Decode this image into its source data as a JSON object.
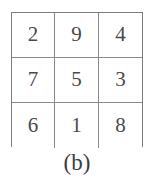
{
  "figure": {
    "caption": "(b)",
    "background_color": "#ffffff",
    "grid_line_color": "#8a8a8a",
    "border_color": "#7c7c7c",
    "digit_color": "#4a4a4a"
  },
  "chart_data": {
    "type": "table",
    "title": "(b)",
    "subtitle": "",
    "xlabel": "",
    "ylabel": "",
    "rows": 3,
    "cols": 3,
    "grid": true,
    "legend": "none",
    "values": [
      [
        2,
        9,
        4
      ],
      [
        7,
        5,
        3
      ],
      [
        6,
        1,
        8
      ]
    ],
    "cells": {
      "r0c0": "2",
      "r0c1": "9",
      "r0c2": "4",
      "r1c0": "7",
      "r1c1": "5",
      "r1c2": "3",
      "r2c0": "6",
      "r2c1": "1",
      "r2c2": "8"
    },
    "annotations": [
      "(b)"
    ]
  }
}
